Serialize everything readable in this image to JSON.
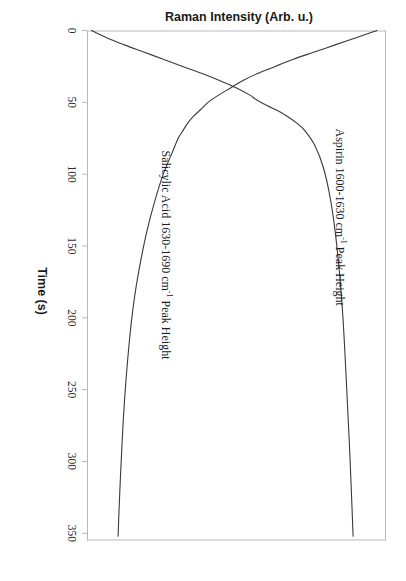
{
  "figure": {
    "background_color": "#ffffff",
    "line_color": "#3a3a3a",
    "axis_color": "#b9b9b9",
    "orientation_note": "rotated"
  },
  "axes": {
    "x_title": "Time (s)",
    "y_title": "Raman Intensity (Arb. u.)",
    "x_ticks": [
      "0",
      "50",
      "100",
      "150",
      "200",
      "250",
      "300",
      "350"
    ]
  },
  "series_labels": {
    "aspirin": {
      "prefix": "Aspirin 1600-1630 cm",
      "superscript": "-1",
      "suffix": " Peak Height"
    },
    "salicylic": {
      "prefix": "Salicylic Acid 1630-1690 cm",
      "superscript": "-1",
      "suffix": " Peak Height"
    }
  },
  "chart_data": {
    "type": "line",
    "title": "",
    "xlabel": "Time (s)",
    "ylabel": "Raman Intensity (Arb. u.)",
    "xlim": [
      0,
      355
    ],
    "ylim": [
      0,
      1.0
    ],
    "grid": false,
    "legend": "inline-curve-labels",
    "x_ticks": [
      0,
      50,
      100,
      150,
      200,
      250,
      300,
      350
    ],
    "series": [
      {
        "name": "Aspirin 1600-1630 cm-1 Peak Height",
        "color": "#3a3a3a",
        "x": [
          0,
          5,
          10,
          15,
          20,
          25,
          30,
          35,
          40,
          45,
          50,
          55,
          60,
          65,
          70,
          75,
          85,
          100,
          120,
          140,
          160,
          180,
          200,
          220,
          250,
          280,
          310,
          340,
          352
        ],
        "y": [
          0.97,
          0.9,
          0.83,
          0.76,
          0.69,
          0.63,
          0.57,
          0.52,
          0.48,
          0.44,
          0.405,
          0.38,
          0.355,
          0.335,
          0.32,
          0.305,
          0.285,
          0.255,
          0.225,
          0.2,
          0.18,
          0.163,
          0.15,
          0.14,
          0.128,
          0.119,
          0.112,
          0.106,
          0.104
        ]
      },
      {
        "name": "Salicylic Acid 1630-1690 cm-1 Peak Height",
        "color": "#3a3a3a",
        "x": [
          0,
          5,
          10,
          15,
          20,
          25,
          30,
          35,
          40,
          45,
          48,
          52,
          56,
          60,
          65,
          70,
          80,
          95,
          115,
          140,
          170,
          200,
          230,
          260,
          290,
          320,
          352
        ],
        "y": [
          0.015,
          0.065,
          0.125,
          0.19,
          0.255,
          0.32,
          0.385,
          0.445,
          0.5,
          0.545,
          0.565,
          0.6,
          0.64,
          0.672,
          0.705,
          0.73,
          0.762,
          0.79,
          0.812,
          0.83,
          0.845,
          0.856,
          0.864,
          0.871,
          0.878,
          0.884,
          0.89
        ]
      }
    ]
  }
}
